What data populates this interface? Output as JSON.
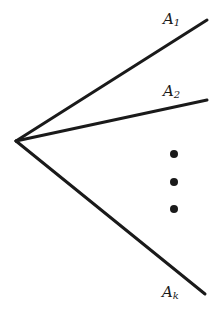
{
  "diagram": {
    "type": "fan of rays from a common vertex",
    "vertex": {
      "x": 16,
      "y": 141
    },
    "rays": [
      {
        "name": "A1",
        "letter": "A",
        "subscript": "1",
        "end": {
          "x": 207,
          "y": 20
        },
        "label_pos": {
          "x": 163,
          "y": 24
        }
      },
      {
        "name": "A2",
        "letter": "A",
        "subscript": "2",
        "end": {
          "x": 207,
          "y": 100
        },
        "label_pos": {
          "x": 163,
          "y": 96
        }
      },
      {
        "name": "Ak",
        "letter": "A",
        "subscript": "k",
        "end": {
          "x": 205,
          "y": 294
        },
        "label_pos": {
          "x": 162,
          "y": 297
        }
      }
    ],
    "ellipsis_dots": [
      {
        "x": 174,
        "y": 154
      },
      {
        "x": 174,
        "y": 182
      },
      {
        "x": 174,
        "y": 209
      }
    ],
    "colors": {
      "stroke": "#1a1a1a",
      "background": "#ffffff"
    }
  }
}
